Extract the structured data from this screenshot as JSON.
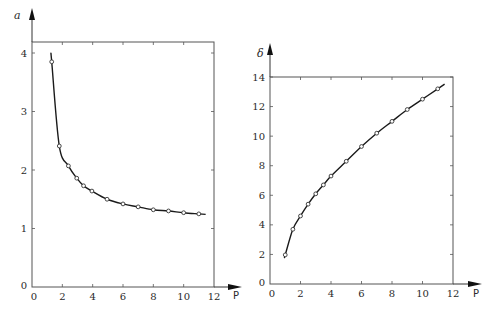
{
  "chart_data": [
    {
      "type": "line",
      "title": "",
      "xlabel": "P",
      "ylabel": "a",
      "xlim": [
        0,
        12
      ],
      "ylim": [
        0,
        4.2
      ],
      "xticks": [
        0,
        2,
        4,
        6,
        8,
        10,
        12
      ],
      "yticks": [
        0,
        1,
        2,
        3,
        4
      ],
      "xtick_labels": [
        "0",
        "2",
        "4",
        "6",
        "8",
        "10",
        "12"
      ],
      "ytick_labels": [
        "0",
        "1",
        "2",
        "3",
        "4"
      ],
      "grid": false,
      "legend": null,
      "series": [
        {
          "name": "a",
          "marker": "open-circle",
          "x": [
            1.3,
            1.8,
            2.4,
            2.95,
            3.4,
            3.95,
            4.95,
            6.0,
            7.0,
            8.0,
            9.0,
            10.0,
            11.0
          ],
          "values": [
            3.85,
            2.41,
            2.07,
            1.86,
            1.73,
            1.64,
            1.5,
            1.42,
            1.37,
            1.32,
            1.3,
            1.27,
            1.25
          ]
        }
      ]
    },
    {
      "type": "line",
      "title": "",
      "xlabel": "P",
      "ylabel": "δ",
      "xlim": [
        0,
        12
      ],
      "ylim": [
        0,
        14
      ],
      "xticks": [
        0,
        2,
        4,
        6,
        8,
        10,
        12
      ],
      "yticks": [
        0,
        2,
        4,
        6,
        8,
        10,
        12,
        14
      ],
      "xtick_labels": [
        "0",
        "2",
        "4",
        "6",
        "8",
        "10",
        "12"
      ],
      "ytick_labels": [
        "0",
        "2",
        "4",
        "6",
        "8",
        "10",
        "12",
        "14"
      ],
      "grid": false,
      "legend": null,
      "series": [
        {
          "name": "δ",
          "marker": "open-circle",
          "x": [
            1.0,
            1.5,
            2.0,
            2.5,
            3.0,
            3.5,
            4.0,
            5.0,
            6.0,
            7.0,
            8.0,
            9.0,
            10.0,
            11.0
          ],
          "values": [
            1.97,
            3.7,
            4.6,
            5.4,
            6.1,
            6.7,
            7.3,
            8.3,
            9.3,
            10.2,
            11.0,
            11.8,
            12.5,
            13.2
          ]
        }
      ]
    }
  ],
  "charts": {
    "left": {
      "ylabel": "a",
      "xlabel": "P"
    },
    "right": {
      "ylabel": "δ",
      "xlabel": "P"
    }
  }
}
